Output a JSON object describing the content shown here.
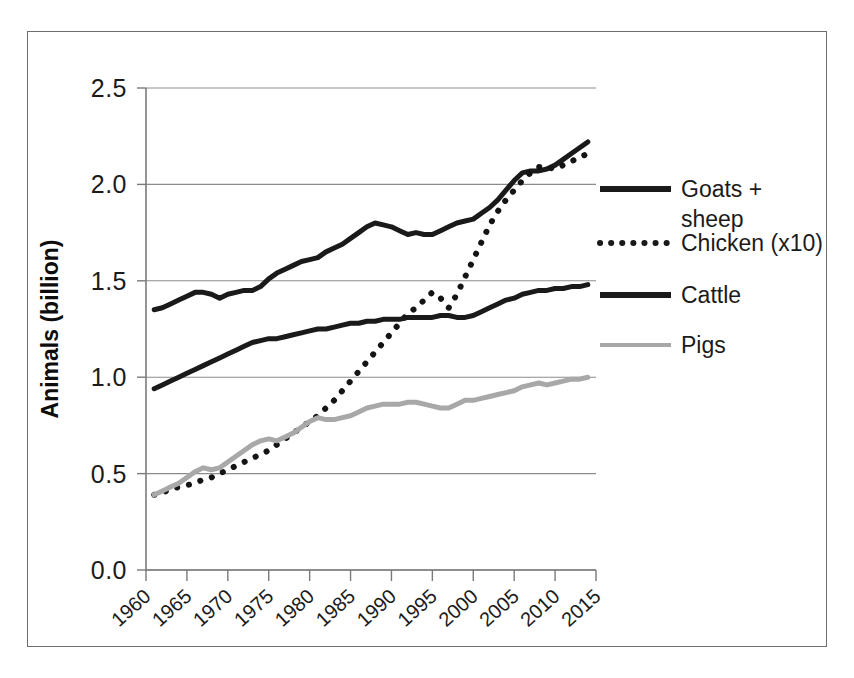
{
  "chart_data": {
    "type": "line",
    "title": "",
    "subtitle": "",
    "xlabel": "",
    "ylabel": "Animals (billion)",
    "xlim": [
      1960,
      2015
    ],
    "ylim": [
      0.0,
      2.5
    ],
    "grid": true,
    "grid_axis": "y",
    "legend_position": "right",
    "x_tick_labels": [
      "1960",
      "1965",
      "1970",
      "1975",
      "1980",
      "1985",
      "1990",
      "1995",
      "2000",
      "2005",
      "2010",
      "2015"
    ],
    "x_ticks": [
      1960,
      1965,
      1970,
      1975,
      1980,
      1985,
      1990,
      1995,
      2000,
      2005,
      2010,
      2015
    ],
    "y_tick_labels": [
      "0.0",
      "0.5",
      "1.0",
      "1.5",
      "2.0",
      "2.5"
    ],
    "y_ticks": [
      0.0,
      0.5,
      1.0,
      1.5,
      2.0,
      2.5
    ],
    "x": [
      1961,
      1962,
      1963,
      1964,
      1965,
      1966,
      1967,
      1968,
      1969,
      1970,
      1971,
      1972,
      1973,
      1974,
      1975,
      1976,
      1977,
      1978,
      1979,
      1980,
      1981,
      1982,
      1983,
      1984,
      1985,
      1986,
      1987,
      1988,
      1989,
      1990,
      1991,
      1992,
      1993,
      1994,
      1995,
      1996,
      1997,
      1998,
      1999,
      2000,
      2001,
      2002,
      2003,
      2004,
      2005,
      2006,
      2007,
      2008,
      2009,
      2010,
      2011,
      2012,
      2013,
      2014
    ],
    "series": [
      {
        "name": "Goats + sheep",
        "style": "solid",
        "color": "#1a1a1a",
        "width": 5,
        "values": [
          1.35,
          1.36,
          1.38,
          1.4,
          1.42,
          1.44,
          1.44,
          1.43,
          1.41,
          1.43,
          1.44,
          1.45,
          1.45,
          1.47,
          1.51,
          1.54,
          1.56,
          1.58,
          1.6,
          1.61,
          1.62,
          1.65,
          1.67,
          1.69,
          1.72,
          1.75,
          1.78,
          1.8,
          1.79,
          1.78,
          1.76,
          1.74,
          1.75,
          1.74,
          1.74,
          1.76,
          1.78,
          1.8,
          1.81,
          1.82,
          1.85,
          1.88,
          1.92,
          1.97,
          2.02,
          2.06,
          2.07,
          2.07,
          2.08,
          2.1,
          2.13,
          2.16,
          2.19,
          2.22
        ]
      },
      {
        "name": "Chicken (x10)",
        "style": "dotted",
        "color": "#141414",
        "width": 5,
        "values": [
          0.39,
          0.4,
          0.42,
          0.43,
          0.44,
          0.45,
          0.47,
          0.48,
          0.5,
          0.52,
          0.54,
          0.56,
          0.58,
          0.6,
          0.62,
          0.65,
          0.68,
          0.71,
          0.74,
          0.77,
          0.8,
          0.84,
          0.88,
          0.93,
          0.98,
          1.03,
          1.08,
          1.13,
          1.18,
          1.23,
          1.28,
          1.33,
          1.36,
          1.4,
          1.44,
          1.41,
          1.36,
          1.43,
          1.52,
          1.61,
          1.7,
          1.79,
          1.86,
          1.92,
          1.97,
          2.02,
          2.06,
          2.09,
          2.09,
          2.08,
          2.1,
          2.12,
          2.14,
          2.16
        ]
      },
      {
        "name": "Cattle",
        "style": "solid",
        "color": "#1a1a1a",
        "width": 5,
        "values": [
          0.94,
          0.96,
          0.98,
          1.0,
          1.02,
          1.04,
          1.06,
          1.08,
          1.1,
          1.12,
          1.14,
          1.16,
          1.18,
          1.19,
          1.2,
          1.2,
          1.21,
          1.22,
          1.23,
          1.24,
          1.25,
          1.25,
          1.26,
          1.27,
          1.28,
          1.28,
          1.29,
          1.29,
          1.3,
          1.3,
          1.3,
          1.31,
          1.31,
          1.31,
          1.31,
          1.32,
          1.32,
          1.31,
          1.31,
          1.32,
          1.34,
          1.36,
          1.38,
          1.4,
          1.41,
          1.43,
          1.44,
          1.45,
          1.45,
          1.46,
          1.46,
          1.47,
          1.47,
          1.48
        ]
      },
      {
        "name": "Pigs",
        "style": "solid",
        "color": "#a8a8a8",
        "width": 5,
        "values": [
          0.39,
          0.41,
          0.43,
          0.45,
          0.48,
          0.51,
          0.53,
          0.52,
          0.53,
          0.56,
          0.59,
          0.62,
          0.65,
          0.67,
          0.68,
          0.67,
          0.69,
          0.71,
          0.74,
          0.77,
          0.79,
          0.78,
          0.78,
          0.79,
          0.8,
          0.82,
          0.84,
          0.85,
          0.86,
          0.86,
          0.86,
          0.87,
          0.87,
          0.86,
          0.85,
          0.84,
          0.84,
          0.86,
          0.88,
          0.88,
          0.89,
          0.9,
          0.91,
          0.92,
          0.93,
          0.95,
          0.96,
          0.97,
          0.96,
          0.97,
          0.98,
          0.99,
          0.99,
          1.0
        ]
      }
    ]
  },
  "legend": {
    "entries": [
      {
        "label_line1": "Goats +",
        "label_line2": "sheep",
        "sample": "solid-thick-black"
      },
      {
        "label_line1": "Chicken (x10)",
        "label_line2": "",
        "sample": "dotted-black"
      },
      {
        "label_line1": "Cattle",
        "label_line2": "",
        "sample": "solid-thick-black"
      },
      {
        "label_line1": "Pigs",
        "label_line2": "",
        "sample": "solid-thick-gray"
      }
    ]
  },
  "colors": {
    "frame": "#6d6d72",
    "gridline": "#8c8c8c",
    "axis": "#7a7a7a",
    "text": "#1b1b1b",
    "dark_series": "#1a1a1a",
    "gray_series": "#a8a8a8",
    "background": "#ffffff"
  }
}
